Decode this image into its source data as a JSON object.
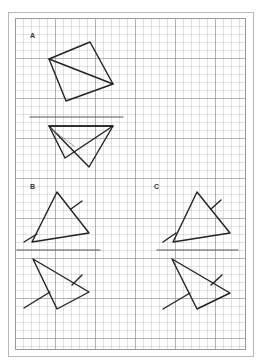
{
  "sheet": {
    "background": "#ffffff",
    "grid_minor_px": 8,
    "grid_major_px": 40,
    "line_color": "#222222"
  },
  "figures": [
    {
      "id": "A",
      "label": "A",
      "label_pos": [
        32,
        39
      ],
      "top_shape": {
        "quad": [
          [
            90,
            42
          ],
          [
            113,
            84
          ],
          [
            66,
            101
          ],
          [
            49,
            59
          ]
        ],
        "diagonal": [
          [
            49,
            59
          ],
          [
            113,
            84
          ]
        ]
      },
      "divider": [
        [
          30,
          117
        ],
        [
          123,
          117
        ]
      ],
      "bottom_shape": {
        "triangle_1": [
          [
            49,
            126
          ],
          [
            113,
            126
          ],
          [
            65,
            158
          ]
        ],
        "triangle_2": [
          [
            49,
            126
          ],
          [
            113,
            126
          ],
          [
            89,
            167
          ]
        ],
        "dashed_fold": [
          [
            50,
            128
          ],
          [
            75,
            147
          ]
        ]
      }
    },
    {
      "id": "B",
      "label": "B",
      "label_pos": [
        32,
        190
      ],
      "top_shape": {
        "triangle": [
          [
            57,
            192
          ],
          [
            89,
            233
          ],
          [
            32,
            242
          ]
        ],
        "stick_upper": [
          [
            71,
            209
          ],
          [
            82,
            201
          ]
        ],
        "stick_lower": [
          [
            24,
            242
          ],
          [
            37,
            234
          ]
        ]
      },
      "divider": [
        [
          17,
          250
        ],
        [
          100,
          250
        ]
      ],
      "bottom_shape": {
        "triangle": [
          [
            33,
            259
          ],
          [
            89,
            292
          ],
          [
            57,
            309
          ]
        ],
        "stick_upper": [
          [
            72,
            285
          ],
          [
            82,
            275
          ]
        ],
        "stick_lower": [
          [
            24,
            308
          ],
          [
            50,
            292
          ]
        ]
      }
    },
    {
      "id": "C",
      "label": "C",
      "label_pos": [
        156,
        190
      ],
      "top_shape": {
        "triangle": [
          [
            197,
            192
          ],
          [
            230,
            233
          ],
          [
            173,
            242
          ]
        ],
        "stick_upper": [
          [
            211,
            209
          ],
          [
            221,
            200
          ]
        ],
        "stick_lower": [
          [
            163,
            242
          ],
          [
            176,
            233
          ]
        ]
      },
      "divider": [
        [
          157,
          250
        ],
        [
          238,
          250
        ]
      ],
      "bottom_shape": {
        "triangle": [
          [
            172,
            259
          ],
          [
            230,
            293
          ],
          [
            197,
            309
          ]
        ],
        "stick_upper": [
          [
            211,
            285
          ],
          [
            222,
            275
          ]
        ],
        "stick_lower": [
          [
            163,
            309
          ],
          [
            190,
            293
          ]
        ]
      }
    }
  ]
}
